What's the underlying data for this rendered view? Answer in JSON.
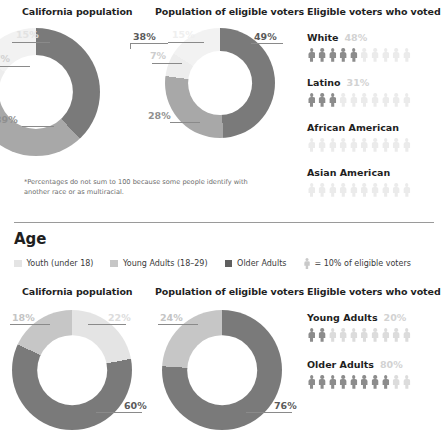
{
  "colors": {
    "dark": "#7a7a7a",
    "mid": "#a8a8a8",
    "light": "#d4d4d4",
    "lighter": "#ededed",
    "very_light": "#f2f2f2",
    "age_dark": "#7a7a7a",
    "age_mid": "#c6c6c6",
    "age_light": "#e4e4e4",
    "label_dark": "#555555",
    "label_faint": "#d8d8d8",
    "person_dark": "#8c8c8c",
    "person_light": "#dcdcdc",
    "person_vlight": "#ebebeb"
  },
  "race_section": {
    "charts": [
      {
        "title": "California population",
        "labels": [
          "38%",
          "39%",
          "7%",
          "15%"
        ]
      },
      {
        "title": "Population of eligible voters",
        "labels": [
          "49%",
          "28%",
          "7%",
          "15%"
        ]
      }
    ],
    "voted_panel": {
      "title": "Eligible voters who voted",
      "rows": [
        {
          "label": "White",
          "pct": "48%"
        },
        {
          "label": "Latino",
          "pct": "31%"
        },
        {
          "label": "African American",
          "pct": ""
        },
        {
          "label": "Asian American",
          "pct": ""
        }
      ]
    },
    "footnote": "*Percentages do not sum to 100 because some people identify with another race or as multiracial."
  },
  "age_section": {
    "title": "Age",
    "legend": [
      {
        "label": "Youth (under 18)"
      },
      {
        "label": "Young Adults (18–29)"
      },
      {
        "label": "Older Adults"
      }
    ],
    "legend_note": "= 10% of eligible voters",
    "charts": [
      {
        "title": "California population",
        "labels": [
          "22%",
          "18%",
          "60%"
        ]
      },
      {
        "title": "Population of eligible voters",
        "labels": [
          "24%",
          "76%"
        ]
      }
    ],
    "voted_panel": {
      "title": "Eligible voters who voted",
      "rows": [
        {
          "label": "Young Adults",
          "pct": "20%"
        },
        {
          "label": "Older Adults",
          "pct": "80%"
        }
      ]
    }
  },
  "chart_data": [
    {
      "type": "pie",
      "title": "California population",
      "subtitle": "Race/ethnicity",
      "categories": [
        "White",
        "Latino",
        "African American",
        "Asian American"
      ],
      "values": [
        38,
        39,
        7,
        15
      ],
      "labels": [
        "38%",
        "39%",
        "7%",
        "15%"
      ],
      "legend_position": "none",
      "note": "Donut chart; percentages do not sum to 100"
    },
    {
      "type": "pie",
      "title": "Population of eligible voters",
      "subtitle": "Race/ethnicity",
      "categories": [
        "White",
        "Latino",
        "African American",
        "Asian American"
      ],
      "values": [
        49,
        28,
        7,
        15
      ],
      "labels": [
        "49%",
        "28%",
        "7%",
        "15%"
      ],
      "legend_position": "none"
    },
    {
      "type": "bar",
      "title": "Eligible voters who voted",
      "subtitle": "Race/ethnicity (pictogram, 1 figure = 10%)",
      "categories": [
        "White",
        "Latino",
        "African American",
        "Asian American"
      ],
      "values": [
        48,
        31,
        null,
        null
      ],
      "labels": [
        "48%",
        "31%",
        "",
        ""
      ],
      "ylim": [
        0,
        100
      ],
      "xlabel": "",
      "ylabel": ""
    },
    {
      "type": "pie",
      "title": "California population",
      "subtitle": "Age",
      "categories": [
        "Youth (under 18)",
        "Young Adults (18–29)",
        "Older Adults"
      ],
      "values": [
        22,
        18,
        60
      ],
      "labels": [
        "22%",
        "18%",
        "60%"
      ],
      "legend_position": "top"
    },
    {
      "type": "pie",
      "title": "Population of eligible voters",
      "subtitle": "Age",
      "categories": [
        "Young Adults (18–29)",
        "Older Adults"
      ],
      "values": [
        24,
        76
      ],
      "labels": [
        "24%",
        "76%"
      ],
      "legend_position": "top"
    },
    {
      "type": "bar",
      "title": "Eligible voters who voted",
      "subtitle": "Age (pictogram, 1 figure = 10%)",
      "categories": [
        "Young Adults",
        "Older Adults"
      ],
      "values": [
        20,
        80
      ],
      "labels": [
        "20%",
        "80%"
      ],
      "ylim": [
        0,
        100
      ],
      "xlabel": "",
      "ylabel": ""
    }
  ]
}
